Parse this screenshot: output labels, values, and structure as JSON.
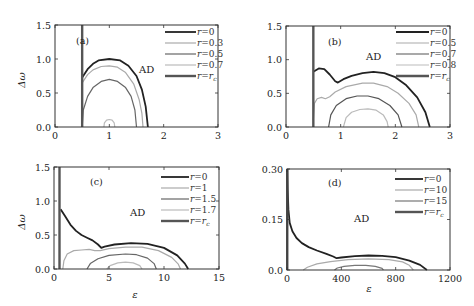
{
  "chart_data": [
    {
      "panel": "(a)",
      "type": "line",
      "xlabel": "",
      "ylabel": "Δω",
      "xlim": [
        0,
        3
      ],
      "ylim": [
        0,
        1.5
      ],
      "xticks": [
        "0",
        "1",
        "2",
        "3"
      ],
      "yticks": [
        "0.0",
        "0.5",
        "1.0",
        "1.5"
      ],
      "region_label": "AD",
      "legend": [
        "r=0",
        "r=0.3",
        "r=0.5",
        "r=0.7",
        "r=r_c"
      ],
      "series": [
        {
          "name": "r=0",
          "color": "#222222",
          "width": 1.8,
          "points": [
            [
              0.5,
              0.73
            ],
            [
              0.6,
              0.85
            ],
            [
              0.7,
              0.93
            ],
            [
              0.8,
              0.98
            ],
            [
              1.0,
              1.0
            ],
            [
              1.2,
              0.98
            ],
            [
              1.35,
              0.9
            ],
            [
              1.5,
              0.75
            ],
            [
              1.6,
              0.55
            ],
            [
              1.67,
              0.3
            ],
            [
              1.71,
              0.0
            ]
          ]
        },
        {
          "name": "r=0.3",
          "color": "#aaaaaa",
          "width": 1.2,
          "points": [
            [
              0.5,
              0.65
            ],
            [
              0.6,
              0.77
            ],
            [
              0.7,
              0.84
            ],
            [
              0.85,
              0.89
            ],
            [
              1.0,
              0.9
            ],
            [
              1.15,
              0.88
            ],
            [
              1.3,
              0.8
            ],
            [
              1.45,
              0.63
            ],
            [
              1.55,
              0.4
            ],
            [
              1.6,
              0.2
            ],
            [
              1.62,
              0.0
            ]
          ]
        },
        {
          "name": "r=0.5",
          "color": "#666666",
          "width": 1.2,
          "points": [
            [
              0.5,
              0.0
            ],
            [
              0.52,
              0.25
            ],
            [
              0.6,
              0.45
            ],
            [
              0.7,
              0.58
            ],
            [
              0.85,
              0.67
            ],
            [
              1.0,
              0.7
            ],
            [
              1.15,
              0.67
            ],
            [
              1.3,
              0.58
            ],
            [
              1.4,
              0.45
            ],
            [
              1.47,
              0.25
            ],
            [
              1.5,
              0.0
            ]
          ]
        },
        {
          "name": "r=0.7",
          "color": "#bbbbbb",
          "width": 1.2,
          "points": [
            [
              0.9,
              0.0
            ],
            [
              0.91,
              0.06
            ],
            [
              0.95,
              0.1
            ],
            [
              1.0,
              0.11
            ],
            [
              1.05,
              0.1
            ],
            [
              1.09,
              0.06
            ],
            [
              1.1,
              0.0
            ]
          ]
        },
        {
          "name": "r=r_c",
          "color": "#555555",
          "width": 2.4,
          "vertical_x": 0.5
        }
      ]
    },
    {
      "panel": "(b)",
      "type": "line",
      "xlabel": "",
      "ylabel": "",
      "xlim": [
        0,
        3
      ],
      "ylim": [
        0,
        1.5
      ],
      "xticks": [
        "0",
        "1",
        "2",
        "3"
      ],
      "yticks": [
        "0.0",
        "0.5",
        "1.0",
        "1.5"
      ],
      "region_label": "AD",
      "legend": [
        "r=0",
        "r=0.5",
        "r=0.7",
        "r=0.8",
        "r=r_c"
      ],
      "series": [
        {
          "name": "r=0",
          "color": "#222222",
          "width": 1.8,
          "points": [
            [
              0.5,
              0.82
            ],
            [
              0.6,
              0.87
            ],
            [
              0.7,
              0.86
            ],
            [
              0.8,
              0.78
            ],
            [
              0.9,
              0.68
            ],
            [
              0.95,
              0.66
            ],
            [
              1.05,
              0.71
            ],
            [
              1.2,
              0.76
            ],
            [
              1.4,
              0.8
            ],
            [
              1.6,
              0.82
            ],
            [
              1.8,
              0.8
            ],
            [
              2.0,
              0.74
            ],
            [
              2.2,
              0.62
            ],
            [
              2.4,
              0.44
            ],
            [
              2.55,
              0.22
            ],
            [
              2.63,
              0.0
            ]
          ]
        },
        {
          "name": "r=0.5",
          "color": "#aaaaaa",
          "width": 1.2,
          "points": [
            [
              0.5,
              0.1
            ],
            [
              0.52,
              0.35
            ],
            [
              0.57,
              0.42
            ],
            [
              0.65,
              0.44
            ],
            [
              0.72,
              0.42
            ],
            [
              0.8,
              0.45
            ],
            [
              0.9,
              0.52
            ],
            [
              1.1,
              0.6
            ],
            [
              1.4,
              0.65
            ],
            [
              1.6,
              0.65
            ],
            [
              1.85,
              0.6
            ],
            [
              2.05,
              0.5
            ],
            [
              2.25,
              0.35
            ],
            [
              2.38,
              0.18
            ],
            [
              2.43,
              0.0
            ]
          ]
        },
        {
          "name": "r=0.7",
          "color": "#555555",
          "width": 1.2,
          "points": [
            [
              0.78,
              0.0
            ],
            [
              0.82,
              0.18
            ],
            [
              0.92,
              0.32
            ],
            [
              1.1,
              0.42
            ],
            [
              1.3,
              0.46
            ],
            [
              1.5,
              0.46
            ],
            [
              1.7,
              0.42
            ],
            [
              1.9,
              0.32
            ],
            [
              2.05,
              0.18
            ],
            [
              2.12,
              0.0
            ]
          ]
        },
        {
          "name": "r=0.8",
          "color": "#bbbbbb",
          "width": 1.2,
          "points": [
            [
              1.05,
              0.0
            ],
            [
              1.1,
              0.14
            ],
            [
              1.2,
              0.22
            ],
            [
              1.35,
              0.26
            ],
            [
              1.5,
              0.27
            ],
            [
              1.65,
              0.25
            ],
            [
              1.78,
              0.18
            ],
            [
              1.85,
              0.08
            ],
            [
              1.87,
              0.0
            ]
          ]
        },
        {
          "name": "r=r_c",
          "color": "#555555",
          "width": 2.4,
          "vertical_x": 0.5
        }
      ]
    },
    {
      "panel": "(c)",
      "type": "line",
      "xlabel": "ε",
      "ylabel": "Δω",
      "xlim": [
        0,
        15
      ],
      "ylim": [
        0,
        1.5
      ],
      "xticks": [
        "0",
        "5",
        "10",
        "15"
      ],
      "yticks": [
        "0.0",
        "0.5",
        "1.0",
        "1.5"
      ],
      "region_label": "AD",
      "legend": [
        "r=0",
        "r=1",
        "r=1.5",
        "r=1.7",
        "r=r_c"
      ],
      "series": [
        {
          "name": "r=0",
          "color": "#222222",
          "width": 1.8,
          "points": [
            [
              0.6,
              0.88
            ],
            [
              1.0,
              0.78
            ],
            [
              1.5,
              0.65
            ],
            [
              2.0,
              0.56
            ],
            [
              2.5,
              0.5
            ],
            [
              3.0,
              0.46
            ],
            [
              3.5,
              0.42
            ],
            [
              4.0,
              0.36
            ],
            [
              4.3,
              0.31
            ],
            [
              4.6,
              0.33
            ],
            [
              5.5,
              0.36
            ],
            [
              7.0,
              0.38
            ],
            [
              8.5,
              0.37
            ],
            [
              10.0,
              0.31
            ],
            [
              11.2,
              0.2
            ],
            [
              11.9,
              0.08
            ],
            [
              12.2,
              0.0
            ]
          ]
        },
        {
          "name": "r=1",
          "color": "#aaaaaa",
          "width": 1.2,
          "points": [
            [
              0.8,
              0.0
            ],
            [
              0.9,
              0.12
            ],
            [
              1.2,
              0.22
            ],
            [
              1.8,
              0.27
            ],
            [
              2.5,
              0.28
            ],
            [
              3.2,
              0.29
            ],
            [
              3.7,
              0.27
            ],
            [
              4.2,
              0.27
            ],
            [
              5.0,
              0.3
            ],
            [
              6.5,
              0.32
            ],
            [
              8.0,
              0.32
            ],
            [
              9.5,
              0.27
            ],
            [
              10.7,
              0.17
            ],
            [
              11.3,
              0.07
            ],
            [
              11.5,
              0.0
            ]
          ]
        },
        {
          "name": "r=1.5",
          "color": "#666666",
          "width": 1.2,
          "points": [
            [
              3.0,
              0.0
            ],
            [
              3.3,
              0.08
            ],
            [
              4.0,
              0.15
            ],
            [
              5.0,
              0.2
            ],
            [
              6.5,
              0.22
            ],
            [
              7.5,
              0.21
            ],
            [
              8.5,
              0.16
            ],
            [
              9.1,
              0.08
            ],
            [
              9.3,
              0.0
            ]
          ]
        },
        {
          "name": "r=1.7",
          "color": "#bbbbbb",
          "width": 1.2,
          "points": [
            [
              4.8,
              0.0
            ],
            [
              5.1,
              0.05
            ],
            [
              5.8,
              0.09
            ],
            [
              6.5,
              0.1
            ],
            [
              7.2,
              0.09
            ],
            [
              7.8,
              0.05
            ],
            [
              8.0,
              0.0
            ]
          ]
        },
        {
          "name": "r=r_c",
          "color": "#555555",
          "width": 2.4,
          "vertical_x": 0.5
        }
      ]
    },
    {
      "panel": "(d)",
      "type": "line",
      "xlabel": "ε",
      "ylabel": "",
      "xlim": [
        0,
        1200
      ],
      "ylim": [
        0,
        0.3
      ],
      "xticks": [
        "0",
        "400",
        "800",
        "1200"
      ],
      "yticks": [
        "0.0",
        "0.15",
        "0.30"
      ],
      "region_label": "AD",
      "legend": [
        "r=0",
        "r=10",
        "r=15",
        "r=r_c"
      ],
      "series": [
        {
          "name": "r=0",
          "color": "#222222",
          "width": 1.8,
          "points": [
            [
              2,
              0.3
            ],
            [
              5,
              0.24
            ],
            [
              10,
              0.18
            ],
            [
              20,
              0.14
            ],
            [
              40,
              0.115
            ],
            [
              70,
              0.095
            ],
            [
              110,
              0.08
            ],
            [
              160,
              0.068
            ],
            [
              220,
              0.058
            ],
            [
              290,
              0.048
            ],
            [
              340,
              0.04
            ],
            [
              365,
              0.035
            ],
            [
              400,
              0.037
            ],
            [
              500,
              0.041
            ],
            [
              600,
              0.043
            ],
            [
              700,
              0.042
            ],
            [
              800,
              0.038
            ],
            [
              900,
              0.028
            ],
            [
              980,
              0.015
            ],
            [
              1030,
              0.0
            ]
          ]
        },
        {
          "name": "r=10",
          "color": "#aaaaaa",
          "width": 1.2,
          "points": [
            [
              120,
              0.0
            ],
            [
              150,
              0.008
            ],
            [
              220,
              0.018
            ],
            [
              320,
              0.025
            ],
            [
              450,
              0.031
            ],
            [
              600,
              0.033
            ],
            [
              750,
              0.031
            ],
            [
              850,
              0.024
            ],
            [
              900,
              0.014
            ],
            [
              930,
              0.0
            ]
          ]
        },
        {
          "name": "r=15",
          "color": "#777777",
          "width": 1.2,
          "points": [
            [
              350,
              0.0
            ],
            [
              370,
              0.006
            ],
            [
              420,
              0.011
            ],
            [
              500,
              0.014
            ],
            [
              580,
              0.014
            ],
            [
              650,
              0.011
            ],
            [
              700,
              0.005
            ],
            [
              710,
              0.0
            ]
          ]
        },
        {
          "name": "r=r_c",
          "color": "#555555",
          "width": 2.4,
          "vertical_x": 2
        }
      ]
    }
  ],
  "panels": {
    "a": {
      "label": "(a)",
      "region": "AD",
      "ylabel": "Δω",
      "xticks": [
        "0",
        "1",
        "2",
        "3"
      ],
      "yticks": [
        "0.0",
        "0.5",
        "1.0",
        "1.5"
      ],
      "legend": [
        "r=0",
        "r=0.3",
        "r=0.5",
        "r=0.7",
        "r=r"
      ],
      "legend_sub": "c"
    },
    "b": {
      "label": "(b)",
      "region": "AD",
      "xticks": [
        "0",
        "1",
        "2",
        "3"
      ],
      "yticks": [
        "0.0",
        "0.5",
        "1.0",
        "1.5"
      ],
      "legend": [
        "r=0",
        "r=0.5",
        "r=0.7",
        "r=0.8",
        "r=r"
      ],
      "legend_sub": "c"
    },
    "c": {
      "label": "(c)",
      "region": "AD",
      "ylabel": "Δω",
      "xlabel": "ε",
      "xticks": [
        "0",
        "5",
        "10",
        "15"
      ],
      "yticks": [
        "0.0",
        "0.5",
        "1.0",
        "1.5"
      ],
      "legend": [
        "r=0",
        "r=1",
        "r=1.5",
        "r=1.7",
        "r=r"
      ],
      "legend_sub": "c"
    },
    "d": {
      "label": "(d)",
      "region": "AD",
      "xlabel": "ε",
      "xticks": [
        "0",
        "400",
        "800",
        "1200"
      ],
      "yticks": [
        "0.0",
        "0.15",
        "0.30"
      ],
      "legend": [
        "r=0",
        "r=10",
        "r=15",
        "r=r"
      ],
      "legend_sub": "c"
    }
  }
}
